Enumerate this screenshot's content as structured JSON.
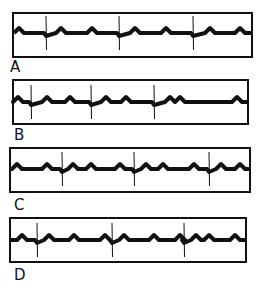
{
  "strips": [
    {
      "label": "A",
      "box": {
        "x": 12,
        "y": 12,
        "w": 241,
        "h": 46
      },
      "label_pos": {
        "x": 10,
        "y": 60
      },
      "baseline_y": 33,
      "spikes": [
        46,
        119,
        193
      ],
      "bumps": [
        19,
        61,
        92,
        135,
        166,
        210,
        240
      ]
    },
    {
      "label": "B",
      "box": {
        "x": 12,
        "y": 79,
        "w": 237,
        "h": 46
      },
      "label_pos": {
        "x": 14,
        "y": 128
      },
      "baseline_y": 102,
      "spikes": [
        31,
        91,
        154
      ],
      "bumps": [
        18,
        47,
        70,
        106,
        126,
        170,
        180,
        237
      ]
    },
    {
      "label": "C",
      "box": {
        "x": 9,
        "y": 147,
        "w": 242,
        "h": 46
      },
      "label_pos": {
        "x": 14,
        "y": 198
      },
      "baseline_y": 169,
      "spikes": [
        62,
        134,
        209
      ],
      "bumps": [
        17,
        47,
        73,
        91,
        120,
        146,
        163,
        194,
        221,
        240
      ]
    },
    {
      "label": "D",
      "box": {
        "x": 9,
        "y": 217,
        "w": 238,
        "h": 46
      },
      "label_pos": {
        "x": 14,
        "y": 268
      },
      "baseline_y": 240,
      "spikes": [
        37,
        112,
        184
      ],
      "bumps": [
        22,
        49,
        74,
        105,
        124,
        154,
        180,
        196,
        209,
        235
      ]
    }
  ],
  "style": {
    "trace_color": "#111111",
    "border_color": "#111111",
    "background": "#ffffff"
  }
}
